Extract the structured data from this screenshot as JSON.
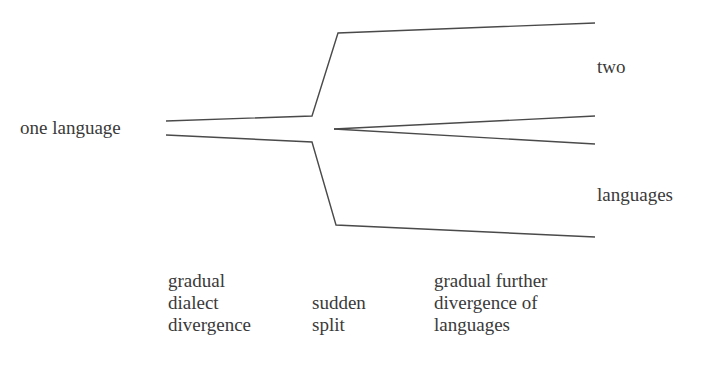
{
  "diagram": {
    "source_label": "one language",
    "target_labels": [
      "two",
      "languages"
    ],
    "stages": [
      {
        "id": "gradual-dialect-divergence",
        "lines": [
          "gradual",
          "dialect",
          "divergence"
        ]
      },
      {
        "id": "sudden-split",
        "lines": [
          "sudden",
          "split"
        ]
      },
      {
        "id": "gradual-further-divergence",
        "lines": [
          "gradual further",
          "divergence of",
          "languages"
        ]
      }
    ],
    "colors": {
      "line": "#4a4a4a",
      "text": "#3a3a3a",
      "background": "#ffffff"
    }
  }
}
